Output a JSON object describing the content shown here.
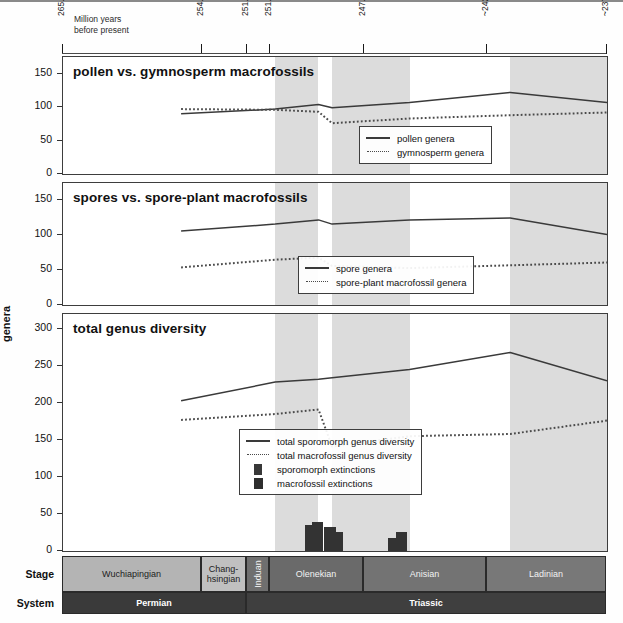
{
  "axis": {
    "note_line1": "Million years",
    "note_line2": "before present",
    "ticks": [
      {
        "label": "265.1",
        "x": 62
      },
      {
        "label": "254.14",
        "x": 201
      },
      {
        "label": "251.902",
        "x": 246
      },
      {
        "label": "251.2",
        "x": 269
      },
      {
        "label": "247.2",
        "x": 363
      },
      {
        "label": "~242",
        "x": 486
      },
      {
        "label": "~237",
        "x": 606
      }
    ],
    "y_axis_title": "genera"
  },
  "panels": [
    {
      "title": "pollen vs. gymnosperm macrofossils",
      "yticks": [
        0,
        50,
        100,
        150
      ],
      "ymax": 175,
      "legend": [
        {
          "key": "solid-line",
          "label": "pollen genera"
        },
        {
          "key": "dotted-line",
          "label": "gymnosperm genera"
        }
      ]
    },
    {
      "title": "spores vs. spore-plant macrofossils",
      "yticks": [
        0,
        50,
        100,
        150
      ],
      "ymax": 175,
      "legend": [
        {
          "key": "solid-line",
          "label": "spore genera"
        },
        {
          "key": "dotted-line",
          "label": "spore-plant macrofossil genera"
        }
      ]
    },
    {
      "title": "total genus diversity",
      "yticks": [
        0,
        50,
        100,
        150,
        200,
        250,
        300
      ],
      "ymax": 320,
      "legend": [
        {
          "key": "solid-line",
          "label": "total sporomorph genus diversity"
        },
        {
          "key": "dotted-line",
          "label": "total macrofossil genus diversity"
        },
        {
          "key": "dark-square-small",
          "label": "sporomorph extinctions"
        },
        {
          "key": "dark-square",
          "label": "macrofossil extinctions"
        }
      ]
    }
  ],
  "chart_data": {
    "type": "line",
    "xlabel": "Million years before present",
    "ylabel": "genera",
    "x_axis_reversed": true,
    "x_tick_values": [
      265.1,
      254.14,
      251.902,
      251.2,
      247.2,
      242,
      237
    ],
    "x_tick_labels": [
      "265.1",
      "254.14",
      "251.902",
      "251.2",
      "247.2",
      "~242",
      "~237"
    ],
    "shaded_bands_ma": [
      [
        254.14,
        251.902
      ],
      [
        251.2,
        247.2
      ],
      [
        242,
        237
      ]
    ],
    "panels": [
      {
        "title": "pollen vs. gymnosperm macrofossils",
        "ylim": [
          0,
          175
        ],
        "yticks": [
          0,
          50,
          100,
          150
        ],
        "series": [
          {
            "name": "pollen genera",
            "style": "solid",
            "x": [
              259.0,
              254.14,
              251.902,
              251.2,
              247.2,
              242.0,
              237.0
            ],
            "values": [
              90,
              97,
              104,
              99,
              107,
              122,
              107
            ]
          },
          {
            "name": "gymnosperm genera",
            "style": "dotted",
            "x": [
              259.0,
              254.14,
              251.902,
              251.2,
              247.2,
              242.0,
              237.0
            ],
            "values": [
              97,
              96,
              93,
              76,
              83,
              88,
              92
            ]
          }
        ]
      },
      {
        "title": "spores vs. spore-plant macrofossils",
        "ylim": [
          0,
          175
        ],
        "yticks": [
          0,
          50,
          100,
          150
        ],
        "series": [
          {
            "name": "spore genera",
            "style": "solid",
            "x": [
              259.0,
              254.14,
              251.902,
              251.2,
              247.2,
              242.0,
              237.0
            ],
            "values": [
              106,
              116,
              122,
              116,
              122,
              125,
              101
            ]
          },
          {
            "name": "spore-plant macrofossil genera",
            "style": "dotted",
            "x": [
              259.0,
              254.14,
              251.902,
              251.2,
              247.2,
              242.0,
              237.0
            ],
            "values": [
              54,
              65,
              68,
              56,
              53,
              57,
              61
            ]
          }
        ]
      },
      {
        "title": "total genus diversity",
        "ylim": [
          0,
          320
        ],
        "yticks": [
          0,
          50,
          100,
          150,
          200,
          250,
          300
        ],
        "series": [
          {
            "name": "total sporomorph genus diversity",
            "style": "solid",
            "x": [
              259.0,
              254.14,
              251.902,
              251.2,
              247.2,
              242.0,
              237.0
            ],
            "values": [
              203,
              228,
              232,
              234,
              245,
              268,
              230
            ]
          },
          {
            "name": "total macrofossil genus diversity",
            "style": "dotted",
            "x": [
              259.0,
              254.14,
              251.902,
              251.2,
              247.2,
              242.0,
              237.0
            ],
            "values": [
              177,
              185,
              191,
              141,
              155,
              158,
              176
            ]
          }
        ],
        "bars": [
          {
            "name": "sporomorph extinctions",
            "at_ma": 252.3,
            "value": 35
          },
          {
            "name": "macrofossil extinctions",
            "at_ma": 251.95,
            "value": 39
          },
          {
            "name": "sporomorph extinctions",
            "at_ma": 251.3,
            "value": 33
          },
          {
            "name": "macrofossil extinctions",
            "at_ma": 250.9,
            "value": 25
          },
          {
            "name": "sporomorph extinctions",
            "at_ma": 248.0,
            "value": 17
          },
          {
            "name": "macrofossil extinctions",
            "at_ma": 247.6,
            "value": 26
          }
        ]
      }
    ]
  },
  "chronostratigraphy": {
    "stage_row_label": "Stage",
    "system_row_label": "System",
    "stages": [
      {
        "name": "Wuchiapingian",
        "x": 62,
        "w": 139,
        "shade": "#b4b4b4",
        "vertical": false
      },
      {
        "name": "Chang-\nhsingian",
        "x": 201,
        "w": 45,
        "shade": "#c0c0c0",
        "vertical": false
      },
      {
        "name": "Induan",
        "x": 246,
        "w": 23,
        "shade": "#6f6f6f",
        "vertical": true
      },
      {
        "name": "Olenekian",
        "x": 269,
        "w": 94,
        "shade": "#6a6a6a",
        "vertical": false
      },
      {
        "name": "Anisian",
        "x": 363,
        "w": 123,
        "shade": "#737373",
        "vertical": false
      },
      {
        "name": "Ladinian",
        "x": 486,
        "w": 120,
        "shade": "#787878",
        "vertical": false
      }
    ],
    "systems": [
      {
        "name": "Permian",
        "x": 62,
        "w": 184,
        "shade": "#3a3a3a"
      },
      {
        "name": "Triassic",
        "x": 246,
        "w": 360,
        "shade": "#3f3f3f"
      }
    ]
  }
}
